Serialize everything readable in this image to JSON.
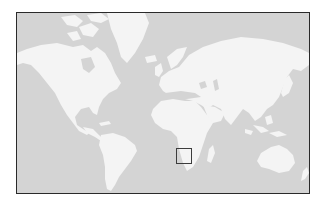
{
  "map": {
    "type": "world-locator-map",
    "projection": "mercator-like",
    "colors": {
      "ocean": "#d4d4d4",
      "land": "#f4f4f4",
      "frame_border": "#2a2a2a",
      "marker_border": "#3c3c3c"
    },
    "frame": {
      "x": 16,
      "y": 12,
      "width": 292,
      "height": 180
    },
    "marker": {
      "shape": "square",
      "label": "Highlighted region: southern Africa",
      "region": "South Africa",
      "x": 175,
      "y": 147,
      "width": 16,
      "height": 16
    },
    "landmasses": [
      "North America",
      "Greenland",
      "South America",
      "Europe",
      "Africa",
      "Asia",
      "Australia",
      "Madagascar",
      "New Zealand",
      "Japan",
      "Indonesia",
      "British Isles",
      "Iceland",
      "Arctic Archipelago"
    ]
  }
}
